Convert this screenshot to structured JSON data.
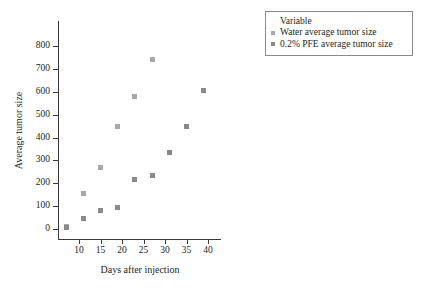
{
  "chart_data": {
    "type": "scatter",
    "title": "",
    "xlabel": "Days after injection",
    "ylabel": "Average tumor size",
    "xlim": [
      5,
      42
    ],
    "ylim": [
      -40,
      860
    ],
    "xticks": [
      10,
      15,
      20,
      25,
      30,
      35,
      40
    ],
    "yticks": [
      0,
      100,
      200,
      300,
      400,
      500,
      600,
      700,
      800
    ],
    "grid": false,
    "legend_position": "top-right",
    "legend_title": "Variable",
    "series": [
      {
        "name": "Water average tumor size",
        "color": "#a8a8a8",
        "marker": "square",
        "x": [
          7,
          11,
          15,
          19,
          23,
          27
        ],
        "y": [
          10,
          155,
          270,
          450,
          580,
          740
        ]
      },
      {
        "name": "0.2% PFE average tumor size",
        "color": "#8a8a8a",
        "marker": "square",
        "x": [
          7,
          11,
          15,
          19,
          23,
          27,
          31,
          35,
          39
        ],
        "y": [
          5,
          45,
          80,
          95,
          215,
          235,
          335,
          450,
          605
        ]
      }
    ]
  },
  "legend": {
    "title": "Variable",
    "entries": [
      {
        "label": "Water average tumor size",
        "color": "#a8a8a8"
      },
      {
        "label": "0.2% PFE average tumor size",
        "color": "#8a8a8a"
      }
    ]
  },
  "axes": {
    "x_title": "Days after injection",
    "y_title": "Average tumor size"
  }
}
